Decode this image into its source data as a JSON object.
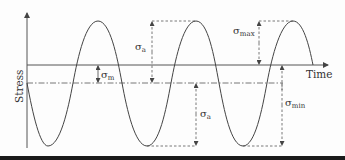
{
  "figure": {
    "type": "fatigue-stress-cycle",
    "axes": {
      "y_label": "Stress",
      "x_label": "Time"
    },
    "annotations": [
      {
        "id": "sigma-m",
        "symbol": "σ",
        "subscript": "m",
        "meaning": "mean stress"
      },
      {
        "id": "sigma-a-upper",
        "symbol": "σ",
        "subscript": "a",
        "meaning": "stress amplitude (above mean)"
      },
      {
        "id": "sigma-a-lower",
        "symbol": "σ",
        "subscript": "a",
        "meaning": "stress amplitude (below mean)"
      },
      {
        "id": "sigma-max",
        "symbol": "σ",
        "subscript": "max",
        "meaning": "maximum stress"
      },
      {
        "id": "sigma-min",
        "symbol": "σ",
        "subscript": "min",
        "meaning": "minimum stress"
      }
    ],
    "lines": {
      "time_axis": "solid",
      "mean_line": "dash-dot"
    },
    "colors": {
      "stroke": "#444444",
      "text": "#333333",
      "bottom_bar": "#1a1a1a"
    }
  }
}
